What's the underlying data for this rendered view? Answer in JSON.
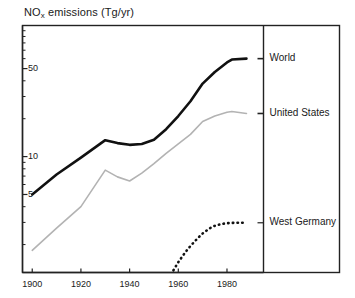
{
  "chart_data": {
    "type": "line",
    "title_main": "NO",
    "title_sub": "x",
    "title_rest": " emissions  (Tg/yr)",
    "xlabel": "",
    "ylabel": "NOx emissions (Tg/yr)",
    "yscale": "log",
    "ylim": [
      1.2,
      110
    ],
    "xlim": [
      1896,
      1995
    ],
    "grid": false,
    "legend_position": "right-panel",
    "ytick_labels": [
      "50",
      "10",
      "5"
    ],
    "ytick_values": [
      50,
      10,
      5
    ],
    "xtick_labels": [
      "1900",
      "1920",
      "1940",
      "1960",
      "1980"
    ],
    "xtick_values": [
      1900,
      1920,
      1940,
      1960,
      1980
    ],
    "series": [
      {
        "name": "World",
        "style": "solid-thick-black",
        "color": "#111111",
        "x": [
          1900,
          1910,
          1920,
          1930,
          1935,
          1940,
          1945,
          1950,
          1955,
          1960,
          1965,
          1970,
          1975,
          1980,
          1982,
          1988
        ],
        "values": [
          5.0,
          7.2,
          9.8,
          13.5,
          12.8,
          12.4,
          12.6,
          13.6,
          16.5,
          21.0,
          27.5,
          38.0,
          47.0,
          56.0,
          59.0,
          60.0
        ]
      },
      {
        "name": "United States",
        "style": "solid-thin-gray",
        "color": "#b3b3b3",
        "x": [
          1900,
          1910,
          1920,
          1930,
          1935,
          1940,
          1945,
          1950,
          1955,
          1960,
          1965,
          1970,
          1975,
          1980,
          1982,
          1988
        ],
        "values": [
          1.8,
          2.7,
          4.0,
          7.8,
          6.9,
          6.4,
          7.4,
          8.8,
          10.6,
          12.6,
          15.0,
          19.0,
          21.0,
          22.5,
          22.8,
          22.0
        ]
      },
      {
        "name": "West Germany",
        "style": "dotted-black",
        "color": "#111111",
        "x": [
          1958,
          1960,
          1963,
          1965,
          1968,
          1970,
          1973,
          1975,
          1978,
          1980,
          1984,
          1988
        ],
        "values": [
          1.25,
          1.45,
          1.75,
          1.95,
          2.25,
          2.45,
          2.7,
          2.82,
          2.92,
          2.96,
          2.98,
          2.98
        ]
      }
    ],
    "annotations": []
  },
  "legend": {
    "entries": [
      {
        "label": "World"
      },
      {
        "label": "United States"
      },
      {
        "label": "West Germany"
      }
    ]
  }
}
